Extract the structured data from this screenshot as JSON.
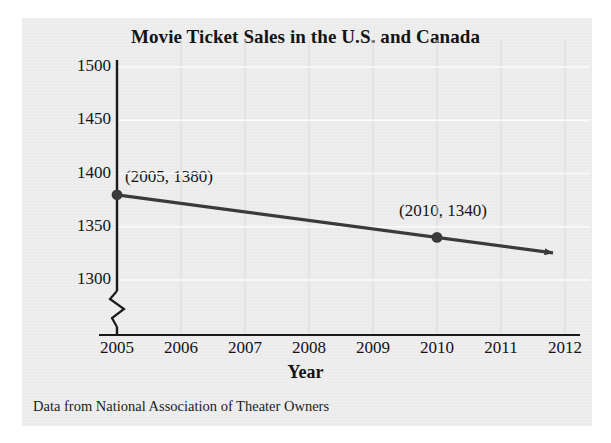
{
  "chart_data": {
    "type": "line",
    "title": "Movie Ticket Sales in the U.S. and Canada",
    "xlabel": "Year",
    "ylabel": "Sales (in millions)",
    "caption": "Data from National Association of Theater Owners",
    "x": [
      2005,
      2010
    ],
    "values": [
      1380,
      1340
    ],
    "series": [
      {
        "name": "Movie ticket sales",
        "x": [
          2005,
          2010
        ],
        "values": [
          1380,
          1340
        ]
      }
    ],
    "point_labels": [
      "(2005, 1380)",
      "(2010, 1340)"
    ],
    "xticks": [
      "2005",
      "2006",
      "2007",
      "2008",
      "2009",
      "2010",
      "2011",
      "2012"
    ],
    "xtick_values": [
      2005,
      2006,
      2007,
      2008,
      2009,
      2010,
      2011,
      2012
    ],
    "yticks": [
      "1500",
      "1450",
      "1400",
      "1350",
      "1300"
    ],
    "ytick_values": [
      1500,
      1450,
      1400,
      1350,
      1300
    ],
    "xlim": [
      2005,
      2012
    ],
    "ylim": [
      1300,
      1500
    ],
    "y_axis_break": true,
    "grid": true,
    "legend": null,
    "line_extends_with_arrow": true,
    "colors": {
      "panel_background": "#ececec",
      "line": "#3a3a3a",
      "marker": "#3a3a3a",
      "axis": "#1a1a1a",
      "text": "#141414",
      "vertical_gridline": "#d8d8d8",
      "horizontal_gridline": "#fbfbfb"
    }
  }
}
